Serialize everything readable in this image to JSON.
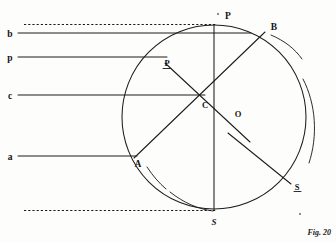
{
  "figure": {
    "caption": "Fig. 20",
    "caption_prefix": "Fig.",
    "caption_number": "20",
    "background_color": "#fdfdfc",
    "ink_color": "#1c1c1c"
  },
  "labels": {
    "ray_b": "b",
    "ray_p": "p",
    "ray_c": "c",
    "ray_a": "a",
    "point_P": "P",
    "point_P_prime": "P",
    "point_B": "B",
    "point_C": "C",
    "point_O": "O",
    "point_A": "A",
    "point_S": "S",
    "point_S_prime": "S"
  },
  "geometry": {
    "circle": {
      "cx": 214,
      "cy": 117,
      "r": 92,
      "label": "main-circle"
    },
    "outer_arc_right": {
      "description": "large arc fragment outside circle on right",
      "label": "outer-arc-right"
    },
    "outer_arc_upper_right": {
      "description": "arc fragment outside circle upper right near B",
      "label": "outer-arc-upper-right"
    },
    "outer_arc_lower_left": {
      "description": "arc fragment outside circle lower left below A",
      "label": "outer-arc-lower-left"
    },
    "outer_arc_bottom": {
      "description": "arc fragment outside circle at bottom left of S",
      "label": "outer-arc-bottom"
    },
    "points": {
      "P": {
        "x": 214,
        "y": 25,
        "note": "top of circle"
      },
      "Pp": {
        "x": 165,
        "y": 62,
        "note": "upper-left on circle"
      },
      "B": {
        "x": 264,
        "y": 31,
        "note": "upper-right on circle"
      },
      "C": {
        "x": 203,
        "y": 100,
        "note": "interior intersection"
      },
      "O": {
        "x": 214,
        "y": 114,
        "note": "centre of circle"
      },
      "A": {
        "x": 135,
        "y": 157,
        "note": "lower-left on circle"
      },
      "S": {
        "x": 214,
        "y": 209,
        "note": "bottom of circle"
      },
      "Sp": {
        "x": 295,
        "y": 185,
        "note": "lower-right outside, on outer arc"
      }
    },
    "rays": [
      {
        "name": "b",
        "y": 33,
        "x_start": 18,
        "x_end": 251,
        "style": "solid"
      },
      {
        "name": "p",
        "y": 57,
        "x_start": 18,
        "x_end": 166,
        "style": "solid"
      },
      {
        "name": "c",
        "y": 95,
        "x_start": 18,
        "x_end": 205,
        "style": "solid"
      },
      {
        "name": "a",
        "y": 156,
        "x_start": 18,
        "x_end": 136,
        "style": "solid"
      }
    ],
    "dashed_lines": [
      {
        "name": "upper-tangent",
        "y": 24,
        "x_start": 24,
        "x_end": 214,
        "style": "dashed"
      },
      {
        "name": "lower-tangent",
        "y": 211,
        "x_start": 24,
        "x_end": 214,
        "style": "dashed"
      }
    ],
    "chords": [
      {
        "name": "A-to-B",
        "from": "A",
        "to": "B"
      },
      {
        "name": "P-prime-to-lower-right",
        "from": "Pp",
        "through": "C",
        "to": "segment end near (250,141)"
      },
      {
        "name": "P-to-S-vertical",
        "from": "P",
        "to": "S"
      },
      {
        "name": "O-to-S-prime",
        "from": "near O",
        "to": "Sp"
      }
    ]
  }
}
